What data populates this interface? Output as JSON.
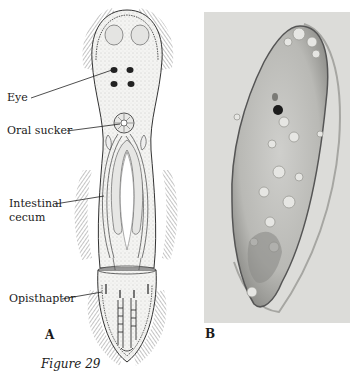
{
  "figure": {
    "caption": "Figure 29",
    "panels": [
      {
        "id": "A",
        "label": "A",
        "type": "line-drawing"
      },
      {
        "id": "B",
        "label": "B",
        "type": "photomicrograph"
      }
    ],
    "annotations": [
      {
        "key": "eye",
        "text": "Eye"
      },
      {
        "key": "oral_sucker",
        "text": "Oral sucker"
      },
      {
        "key": "intestinal_cecum_1",
        "text": "Intestinal"
      },
      {
        "key": "intestinal_cecum_2",
        "text": "cecum"
      },
      {
        "key": "opisthaptor",
        "text": "Opisthaptor"
      }
    ]
  }
}
